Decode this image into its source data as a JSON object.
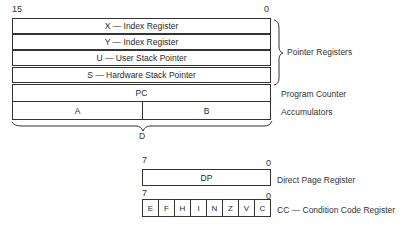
{
  "main_registers": {
    "bit_high": "15",
    "bit_low": "0",
    "rows": [
      {
        "name": "X — Index Register"
      },
      {
        "name": "Y — Index Register"
      },
      {
        "name": "U — User Stack Pointer"
      },
      {
        "name": "S — Hardware Stack Pointer"
      },
      {
        "name": "PC"
      }
    ],
    "accumulators": {
      "a": "A",
      "b": "B",
      "combined": "D"
    },
    "labels": {
      "pointer_registers": "Pointer Registers",
      "program_counter": "Program Counter",
      "accumulators": "Accumulators"
    }
  },
  "dp_register": {
    "bit_high": "7",
    "bit_low": "0",
    "name": "DP",
    "label": "Direct Page Register"
  },
  "cc_register": {
    "bit_high": "7",
    "bit_low": "0",
    "flags": [
      "E",
      "F",
      "H",
      "I",
      "N",
      "Z",
      "V",
      "C"
    ],
    "label": "CC — Condition Code Register"
  }
}
